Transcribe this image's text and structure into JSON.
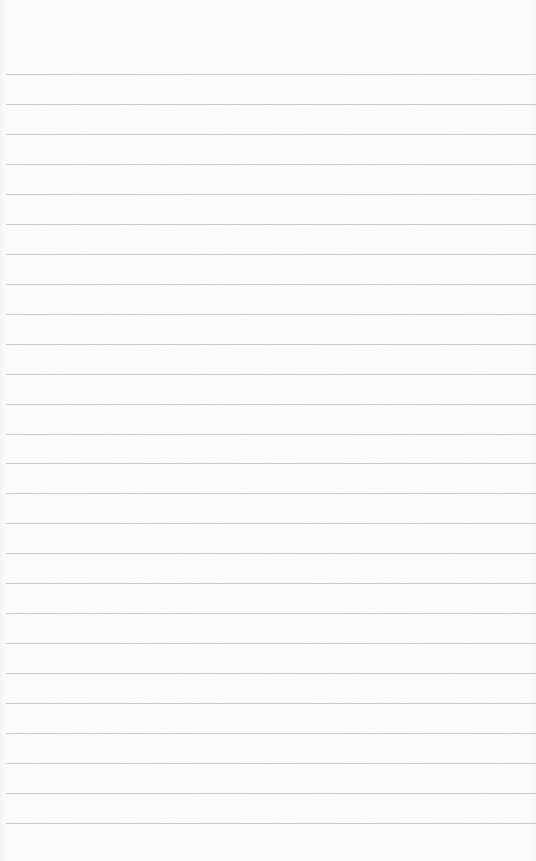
{
  "page": {
    "type": "blank-lined-paper",
    "background_color": "#fbfbfb",
    "rule_color": "#c9c9c9",
    "rule_count": 26,
    "first_rule_y": 74,
    "rule_spacing": 29.96,
    "rule_left_offset": 6
  }
}
